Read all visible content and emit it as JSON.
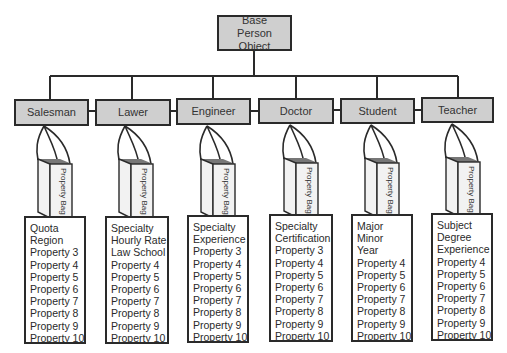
{
  "diagram": {
    "root": {
      "label": "Base Person Object"
    },
    "bag_label": "Property Bag",
    "children": [
      {
        "label": "Salesman",
        "properties": [
          "Quota",
          "Region",
          "Property 3",
          "Property 4",
          "Property 5",
          "Property 6",
          "Property 7",
          "Property 8",
          "Property 9",
          "Property 10"
        ]
      },
      {
        "label": "Lawer",
        "properties": [
          "Specialty",
          "Hourly Rate",
          "Law School",
          "Property 4",
          "Property 5",
          "Property 6",
          "Property 7",
          "Property 8",
          "Property 9",
          "Property 10"
        ]
      },
      {
        "label": "Engineer",
        "properties": [
          "Specialty",
          "Experience",
          "Property 3",
          "Property 4",
          "Property 5",
          "Property 6",
          "Property 7",
          "Property 8",
          "Property 9",
          "Property 10"
        ]
      },
      {
        "label": "Doctor",
        "properties": [
          "Specialty",
          "Certification",
          "Property 3",
          "Property 4",
          "Property 5",
          "Property 6",
          "Property 7",
          "Property 8",
          "Property 9",
          "Property 10"
        ]
      },
      {
        "label": "Student",
        "properties": [
          "Major",
          "Minor",
          "Year",
          "Property 4",
          "Property 5",
          "Property 6",
          "Property 7",
          "Property 8",
          "Property 9",
          "Property 10"
        ]
      },
      {
        "label": "Teacher",
        "properties": [
          "Subject",
          "Degree",
          "Experience",
          "Property 4",
          "Property 5",
          "Property 6",
          "Property 7",
          "Property 8",
          "Property 9",
          "Property 10"
        ]
      }
    ],
    "colors": {
      "node_fill": "#cfcfcf",
      "bag_fill": "#f2f2f2",
      "bag_top": "#777777",
      "stroke": "#2a2a2a"
    }
  }
}
